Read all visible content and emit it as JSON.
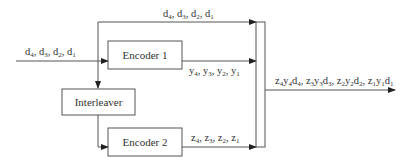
{
  "diagram": {
    "blocks": {
      "encoder1": "Encoder 1",
      "encoder2": "Encoder 2",
      "interleaver": "Interleaver"
    },
    "signals": {
      "input": {
        "prefix": "d",
        "indices": [
          "4",
          "3",
          "2",
          "1"
        ]
      },
      "systematic": {
        "prefix": "d",
        "indices": [
          "4",
          "3",
          "2",
          "1"
        ]
      },
      "parity1": {
        "prefix": "y",
        "indices": [
          "4",
          "3",
          "2",
          "1"
        ]
      },
      "parity2": {
        "prefix": "z",
        "indices": [
          "4",
          "3",
          "2",
          "1"
        ]
      },
      "output": {
        "groups": [
          [
            "z",
            "4",
            "y",
            "4",
            "d",
            "4"
          ],
          [
            "z",
            "3",
            "y",
            "3",
            "d",
            "3"
          ],
          [
            "z",
            "2",
            "y",
            "2",
            "d",
            "2"
          ],
          [
            "z",
            "1",
            "y",
            "1",
            "d",
            "1"
          ]
        ]
      }
    },
    "colors": {
      "line": "#555555",
      "text": "#333333",
      "background": "#ffffff"
    }
  }
}
